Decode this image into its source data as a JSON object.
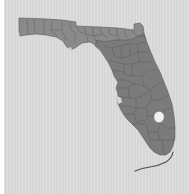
{
  "map": {
    "region": "Florida",
    "subdivisions": "counties",
    "colors": {
      "background": "#d7d7d7",
      "land": "#7b7b7b",
      "land_north": "#8a8a8a",
      "borders": "#4e4e4e",
      "lake": "#f2f2f2"
    },
    "features": {
      "lake": "Lake Okeechobee",
      "keys": "Florida Keys",
      "bay": "Tampa Bay"
    }
  }
}
